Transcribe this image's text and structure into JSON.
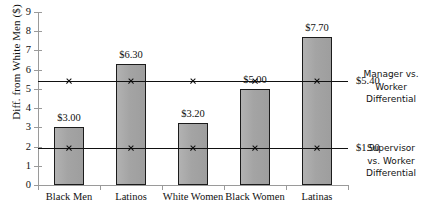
{
  "chart_data": {
    "type": "bar",
    "title": "",
    "subtitle": "",
    "xlabel": "",
    "ylabel": "Diff. from White Men ($)",
    "ylim": [
      0,
      9
    ],
    "ytick_labels": [
      "0",
      "1",
      "2",
      "3",
      "4",
      "5",
      "6",
      "7",
      "8",
      "9"
    ],
    "ytick_values": [
      0,
      1,
      2,
      3,
      4,
      5,
      6,
      7,
      8,
      9
    ],
    "grid": false,
    "legend_position": "right",
    "categories": [
      "Black Men",
      "Latinos",
      "White Women",
      "Black Women",
      "Latinas"
    ],
    "values": [
      3.0,
      6.3,
      3.2,
      5.0,
      7.7
    ],
    "value_labels": [
      "$3.00",
      "$6.30",
      "$3.20",
      "$5.00",
      "$7.70"
    ],
    "series": [
      {
        "name": "Diff. from White Men ($)",
        "type": "bar",
        "values": [
          3.0,
          6.3,
          3.2,
          5.0,
          7.7
        ]
      },
      {
        "name": "Manager vs. Worker Differential",
        "type": "reference-line",
        "value": 5.4,
        "label": "$5.40",
        "marker": "x"
      },
      {
        "name": "Supervisor vs. Worker Differential",
        "type": "reference-line",
        "value": 1.9,
        "label": "$1.90",
        "marker": "x"
      }
    ],
    "annotations": [
      {
        "text": "$5.40",
        "value": 5.4
      },
      {
        "text": "$1.90",
        "value": 1.9
      }
    ],
    "colors": {
      "bar_fill": "#a9a9a9",
      "bar_border": "#1b1b1b",
      "axis": "#9a9a9a",
      "reference_line": "#111111",
      "text": "#111111",
      "background": "#ffffff"
    }
  },
  "axis": {
    "y_title": "Diff. from White Men ($)",
    "y_ticks": [
      "9",
      "8",
      "7",
      "6",
      "5",
      "4",
      "3",
      "2",
      "1",
      "0"
    ]
  },
  "bars": [
    {
      "category": "Black Men",
      "value": 3.0,
      "label": "$3.00"
    },
    {
      "category": "Latinos",
      "value": 6.3,
      "label": "$6.30"
    },
    {
      "category": "White Women",
      "value": 3.2,
      "label": "$3.20"
    },
    {
      "category": "Black Women",
      "value": 5.0,
      "label": "$5.00"
    },
    {
      "category": "Latinas",
      "value": 7.7,
      "label": "$7.70"
    }
  ],
  "reference_lines": [
    {
      "value": 5.4,
      "label": "$5.40",
      "legend": "Manager vs. Worker Differential"
    },
    {
      "value": 1.9,
      "label": "$1.90",
      "legend": "Supervisor vs. Worker Differential"
    }
  ],
  "legend": {
    "manager_line1": "Manager vs.",
    "manager_line2": "Worker",
    "manager_line3": "Differential",
    "supervisor_line1": "Supervisor",
    "supervisor_line2": "vs. Worker",
    "supervisor_line3": "Differential"
  }
}
